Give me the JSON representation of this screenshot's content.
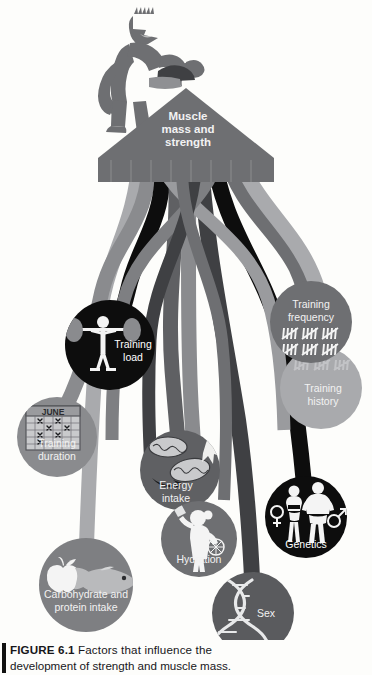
{
  "page": {
    "background_color": "#fdfdfb",
    "faint_running_header": "                                                      "
  },
  "figure": {
    "number": "6.1",
    "label_prefix": "FIGURE",
    "caption_line1": "Factors that influence the",
    "caption_line2": "development of strength and muscle mass.",
    "caption_full": "FIGURE 6.1 Factors that influence the development of strength and muscle mass."
  },
  "central": {
    "arrow_label_line1": "Muscle",
    "arrow_label_line2": "mass and",
    "arrow_label_line3": "strength",
    "arrow_label": "Muscle mass and strength",
    "mascot": "bodybuilder-flexing-figure",
    "arrow_color": "#6e6f72"
  },
  "colors": {
    "black": "#0d0d0d",
    "dark_gray": "#3f4043",
    "mid_gray": "#6e6f72",
    "gray": "#8a8b8e",
    "light_gray": "#a9aaad",
    "pale_gray": "#c3c4c6",
    "label_text": "#f2f2f2",
    "caption_text": "#17161a"
  },
  "factors": [
    {
      "id": "training-load",
      "label": "Training load",
      "label_lines": [
        "Training",
        "load"
      ],
      "icon": "barbell-lifter-icon",
      "fill": "#0d0d0d",
      "cx": 110,
      "cy": 345,
      "r": 45
    },
    {
      "id": "training-duration",
      "label": "Training duration",
      "label_lines": [
        "Training",
        "duration"
      ],
      "icon": "calendar-june-icon",
      "icon_text": "JUNE",
      "fill": "#8a8b8e",
      "cx": 57,
      "cy": 437,
      "r": 40
    },
    {
      "id": "energy-intake",
      "label": "Energy intake",
      "label_lines": [
        "Energy",
        "intake"
      ],
      "icon": "mitochondria-icon",
      "fill": "#5f6063",
      "cx": 180,
      "cy": 470,
      "r": 40
    },
    {
      "id": "hydration",
      "label": "Hydration",
      "label_lines": [
        "Hydration"
      ],
      "icon": "person-drinking-bottle-icon",
      "fill": "#6e6f72",
      "cx": 199,
      "cy": 539,
      "r": 38
    },
    {
      "id": "carbohydrate-and-protein-intake",
      "label": "Carbohydrate and protein intake",
      "label_lines": [
        "Carbohydrate and",
        "protein intake"
      ],
      "icon": "apple-and-fish-icon",
      "fill": "#7e7f82",
      "cx": 86,
      "cy": 585,
      "r": 47
    },
    {
      "id": "genetics",
      "label": "Genetics",
      "label_lines": [
        "Genetics"
      ],
      "icon": "dna-helix-icon",
      "fill": "#5a5b5e",
      "cx": 253,
      "cy": 613,
      "r": 41
    },
    {
      "id": "sex",
      "label": "Sex",
      "label_lines": [
        "Sex"
      ],
      "icon": "male-female-figures-icon",
      "fill": "#0d0d0d",
      "cx": 306,
      "cy": 517,
      "r": 41
    },
    {
      "id": "training-frequency",
      "label": "Training frequency",
      "label_lines": [
        "Training",
        "frequency"
      ],
      "icon": "tally-marks-icon",
      "fill": "#6e6f72",
      "cx": 311,
      "cy": 322,
      "r": 41
    },
    {
      "id": "training-history",
      "label": "Training history",
      "label_lines": [
        "Training",
        "history"
      ],
      "icon": "faded-tally-marks-icon",
      "fill": "#a9aaad",
      "cx": 321,
      "cy": 388,
      "r": 41
    }
  ],
  "connectors": [
    {
      "from": "training-load",
      "color": "#0d0d0d"
    },
    {
      "from": "training-duration",
      "color": "#8a8b8e"
    },
    {
      "from": "energy-intake",
      "color": "#5f6063"
    },
    {
      "from": "hydration",
      "color": "#6e6f72"
    },
    {
      "from": "carbohydrate-and-protein-intake",
      "color": "#7e7f82"
    },
    {
      "from": "genetics",
      "color": "#5a5b5e"
    },
    {
      "from": "sex",
      "color": "#0d0d0d"
    },
    {
      "from": "training-frequency",
      "color": "#6e6f72"
    },
    {
      "from": "training-history",
      "color": "#a9aaad"
    }
  ]
}
